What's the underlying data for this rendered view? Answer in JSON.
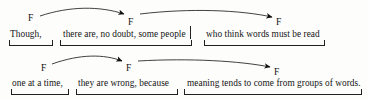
{
  "diagram": {
    "fixation_label": "F",
    "ink_color": "#1a1a1a",
    "background_color": "#fdfdfc"
  },
  "rows": [
    {
      "id": "row-1",
      "fixations": [
        {
          "label": "F",
          "x": 28,
          "y": 13
        },
        {
          "label": "F",
          "x": 128,
          "y": 17
        },
        {
          "label": "F",
          "x": 276,
          "y": 17
        }
      ],
      "saccades": [
        {
          "from": "F1",
          "to": "F2",
          "path": "M 40 16 C 70 6, 100 6, 124 14"
        },
        {
          "from": "F2",
          "to": "F3",
          "path": "M 140 14 C 190 8, 240 10, 272 17"
        }
      ],
      "phrases": [
        {
          "text": "Though,",
          "x": 10,
          "y": 29
        },
        {
          "text": "there are, no doubt, some people",
          "x": 63,
          "y": 29
        },
        {
          "text": "who think words must be read",
          "x": 206,
          "y": 29
        }
      ],
      "brackets": [
        {
          "x": 9,
          "y": 40,
          "width": 44,
          "heavy": false
        },
        {
          "x": 60,
          "y": 40,
          "width": 132,
          "heavy": false
        },
        {
          "x": 204,
          "y": 40,
          "width": 121,
          "heavy": false
        }
      ],
      "caret": {
        "x": 190,
        "y": 26,
        "height": 13
      }
    },
    {
      "id": "row-2",
      "fixations": [
        {
          "label": "F",
          "x": 41,
          "y": 13
        },
        {
          "label": "F",
          "x": 126,
          "y": 13
        },
        {
          "label": "F",
          "x": 274,
          "y": 17
        }
      ],
      "saccades": [
        {
          "from": "F1",
          "to": "F2",
          "path": "M 52 14 C 80 4, 104 4, 122 11"
        },
        {
          "from": "F2",
          "to": "F3",
          "path": "M 138 11 C 190 8, 240 11, 270 17"
        }
      ],
      "phrases": [
        {
          "text": "one at a time,",
          "x": 12,
          "y": 28
        },
        {
          "text": "they are wrong, because",
          "x": 78,
          "y": 28
        },
        {
          "text": "meaning tends to come from groups of words.",
          "x": 187,
          "y": 28
        }
      ],
      "brackets": [
        {
          "x": 11,
          "y": 39,
          "width": 58,
          "heavy": false
        },
        {
          "x": 76,
          "y": 39,
          "width": 102,
          "heavy": false
        },
        {
          "x": 184,
          "y": 39,
          "width": 178,
          "heavy": true
        }
      ],
      "caret": null
    }
  ]
}
